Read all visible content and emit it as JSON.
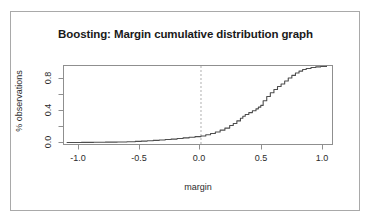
{
  "figure": {
    "title": "Boosting: Margin cumulative distribution graph",
    "xlabel": "margin",
    "ylabel": "% observations",
    "frame_color": "#a9a9a9",
    "curve_color": "#4d4d4d",
    "refline_color": "#b0b0b0"
  },
  "axis": {
    "x_ticks": [
      "-1.0",
      "-0.5",
      "0.0",
      "0.5",
      "1.0"
    ],
    "y_ticks": [
      "0.0",
      "0.4",
      "0.8"
    ]
  },
  "chart_data": {
    "type": "line",
    "title": "Boosting: Margin cumulative distribution graph",
    "subtitle": "",
    "xlabel": "margin",
    "ylabel": "% observations",
    "xlim": [
      -1.15,
      1.1
    ],
    "ylim": [
      -0.02,
      1.0
    ],
    "x_ticks": [
      -1.0,
      -0.5,
      0.0,
      0.5,
      1.0
    ],
    "y_ticks": [
      0.0,
      0.2,
      0.4,
      0.6,
      0.8
    ],
    "y_tick_labels_shown": [
      0.0,
      0.4,
      0.8
    ],
    "grid": false,
    "legend": null,
    "annotations": [
      {
        "type": "vline",
        "x": 0.0,
        "style": "dashed",
        "color": "#b0b0b0",
        "label": "margin = 0"
      }
    ],
    "series": [
      {
        "name": "cumulative margin distribution",
        "style": "step",
        "color": "#4d4d4d",
        "x": [
          -1.12,
          -1.0,
          -0.9,
          -0.8,
          -0.7,
          -0.62,
          -0.55,
          -0.5,
          -0.45,
          -0.4,
          -0.35,
          -0.3,
          -0.25,
          -0.2,
          -0.15,
          -0.1,
          -0.05,
          0.0,
          0.04,
          0.08,
          0.12,
          0.16,
          0.2,
          0.24,
          0.27,
          0.3,
          0.33,
          0.35,
          0.37,
          0.4,
          0.43,
          0.46,
          0.48,
          0.5,
          0.52,
          0.55,
          0.58,
          0.61,
          0.64,
          0.67,
          0.7,
          0.73,
          0.76,
          0.79,
          0.82,
          0.85,
          0.88,
          0.92,
          0.96,
          1.0,
          1.05
        ],
        "y": [
          0.005,
          0.007,
          0.009,
          0.011,
          0.013,
          0.016,
          0.02,
          0.024,
          0.028,
          0.033,
          0.038,
          0.044,
          0.05,
          0.057,
          0.065,
          0.073,
          0.082,
          0.09,
          0.105,
          0.122,
          0.142,
          0.165,
          0.192,
          0.225,
          0.252,
          0.285,
          0.318,
          0.345,
          0.368,
          0.392,
          0.415,
          0.44,
          0.462,
          0.485,
          0.545,
          0.6,
          0.648,
          0.69,
          0.728,
          0.762,
          0.8,
          0.838,
          0.872,
          0.903,
          0.928,
          0.948,
          0.962,
          0.974,
          0.982,
          0.988,
          0.99
        ]
      }
    ]
  }
}
